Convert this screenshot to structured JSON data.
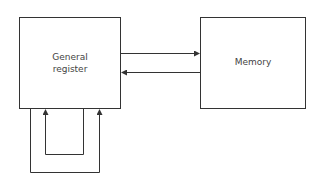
{
  "nodes": {
    "general_register": {
      "label_line1": "General",
      "label_line2": "register"
    },
    "memory": {
      "label": "Memory"
    }
  },
  "edges": [
    {
      "from": "general_register",
      "to": "memory"
    },
    {
      "from": "memory",
      "to": "general_register"
    },
    {
      "from": "general_register",
      "to": "general_register",
      "type": "loop-inner"
    },
    {
      "from": "general_register",
      "to": "general_register",
      "type": "loop-outer"
    }
  ]
}
